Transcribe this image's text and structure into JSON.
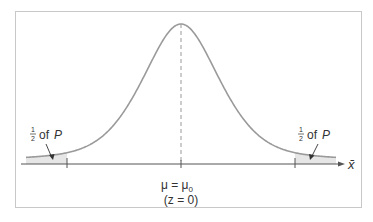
{
  "diagram": {
    "type": "normal-distribution-two-tailed",
    "center_label": "μ = μ",
    "center_label_subscript": "0",
    "z_label": "(z = 0)",
    "axis_label": "x̄",
    "left_tail_label": {
      "fraction_num": "1",
      "fraction_den": "2",
      "text": "of",
      "var": "P"
    },
    "right_tail_label": {
      "fraction_num": "1",
      "fraction_den": "2",
      "text": "of",
      "var": "P"
    },
    "colors": {
      "curve": "#9a9a9a",
      "tail_fill": "#e6e6e6",
      "axis": "#555555",
      "frame": "#c8c8c8",
      "text": "#333333"
    }
  }
}
